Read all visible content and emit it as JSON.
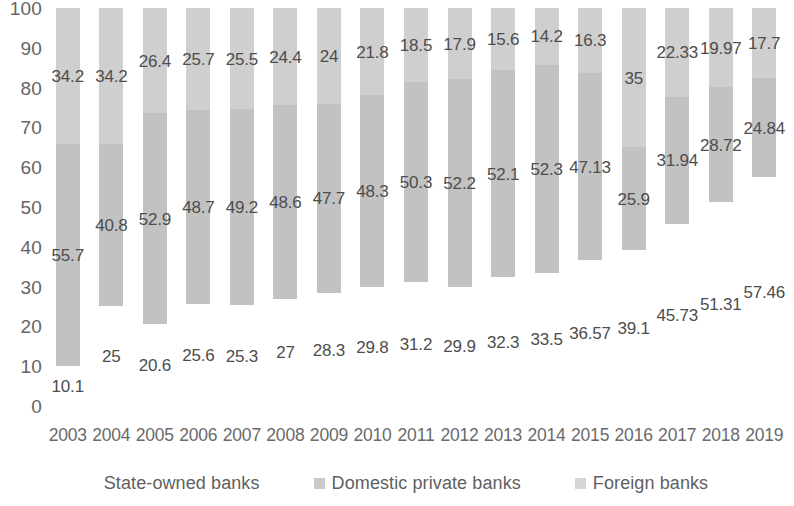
{
  "chart_data": {
    "type": "bar",
    "title": "",
    "subtitle": "",
    "xlabel": "",
    "ylabel": "",
    "stacked": true,
    "stack_mode": "percent",
    "grid": false,
    "legend_position": "bottom",
    "ylim": [
      0,
      100
    ],
    "y_ticks": [
      "0",
      "10",
      "20",
      "30",
      "40",
      "50",
      "60",
      "70",
      "80",
      "90",
      "100"
    ],
    "categories": [
      "2003",
      "2004",
      "2005",
      "2006",
      "2007",
      "2008",
      "2009",
      "2010",
      "2011",
      "2012",
      "2013",
      "2014",
      "2015",
      "2016",
      "2017",
      "2018",
      "2019"
    ],
    "series": [
      {
        "name": "State-owned banks",
        "color": "#ffffff",
        "values": [
          10.1,
          25,
          20.6,
          25.6,
          25.3,
          27,
          28.3,
          29.8,
          31.2,
          29.9,
          32.3,
          33.5,
          36.57,
          39.1,
          45.73,
          51.31,
          57.46
        ],
        "labels": [
          "10.1",
          "25",
          "20.6",
          "25.6",
          "25.3",
          "27",
          "28.3",
          "29.8",
          "31.2",
          "29.9",
          "32.3",
          "33.5",
          "36.57",
          "39.1",
          "45.73",
          "51.31",
          "57.46"
        ]
      },
      {
        "name": "Domestic private banks",
        "color": "#c2c2c2",
        "values": [
          55.7,
          40.8,
          52.9,
          48.7,
          49.2,
          48.6,
          47.7,
          48.3,
          50.3,
          52.2,
          52.1,
          52.3,
          47.13,
          25.9,
          31.94,
          28.72,
          24.84
        ],
        "labels": [
          "55.7",
          "40.8",
          "52.9",
          "48.7",
          "49.2",
          "48.6",
          "47.7",
          "48.3",
          "50.3",
          "52.2",
          "52.1",
          "52.3",
          "47.13",
          "25.9",
          "31.94",
          "28.72",
          "24.84"
        ]
      },
      {
        "name": "Foreign banks",
        "color": "#cfcfcf",
        "values": [
          34.2,
          34.2,
          26.4,
          25.7,
          25.5,
          24.4,
          24,
          21.8,
          18.5,
          17.9,
          15.6,
          14.2,
          16.3,
          35,
          22.33,
          19.97,
          17.7
        ],
        "labels": [
          "34.2",
          "34.2",
          "26.4",
          "25.7",
          "25.5",
          "24.4",
          "24",
          "21.8",
          "18.5",
          "17.9",
          "15.6",
          "14.2",
          "16.3",
          "35",
          "22.33",
          "19.97",
          "17.7"
        ]
      }
    ]
  },
  "legend": {
    "items": [
      {
        "label": "State-owned banks",
        "swatch_class": "sw-state"
      },
      {
        "label": "Domestic private banks",
        "swatch_class": "sw-domestic"
      },
      {
        "label": "Foreign banks",
        "swatch_class": "sw-foreign"
      }
    ]
  },
  "colors": {
    "state_owned": "#ffffff",
    "domestic_private": "#c2c2c2",
    "foreign": "#cfcfcf",
    "text": "#5a5a5a",
    "background": "#ffffff"
  }
}
